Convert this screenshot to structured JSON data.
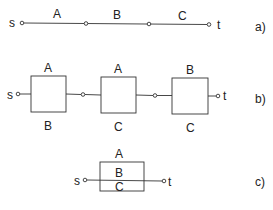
{
  "panels": {
    "a": {
      "tag": "a)",
      "source": "s",
      "sink": "t",
      "edges": [
        "A",
        "B",
        "C"
      ]
    },
    "b": {
      "tag": "b)",
      "source": "s",
      "sink": "t",
      "blocks": [
        {
          "top": "A",
          "bottom": "B"
        },
        {
          "top": "A",
          "bottom": "C"
        },
        {
          "top": "B",
          "bottom": "C"
        }
      ]
    },
    "c": {
      "tag": "c)",
      "source": "s",
      "sink": "t",
      "top": "A",
      "middle": "B",
      "bottom": "C"
    }
  },
  "colors": {
    "stroke": "#333333",
    "background": "#ffffff"
  }
}
